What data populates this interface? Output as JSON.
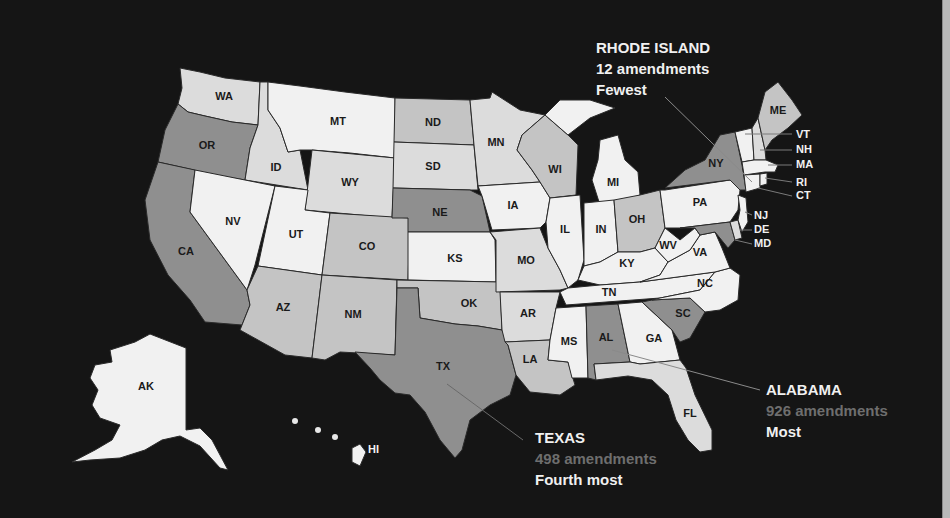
{
  "map": {
    "title": "",
    "legend_shades": {
      "lightest": "#f1f1f1",
      "light": "#dcdcdc",
      "medium_light": "#c4c4c4",
      "medium": "#8f8f8f",
      "background": "#151515"
    },
    "states": {
      "WA": {
        "label": "WA",
        "tier": "light"
      },
      "OR": {
        "label": "OR",
        "tier": "medium"
      },
      "CA": {
        "label": "CA",
        "tier": "medium"
      },
      "ID": {
        "label": "ID",
        "tier": "light"
      },
      "NV": {
        "label": "NV",
        "tier": "lightest"
      },
      "MT": {
        "label": "MT",
        "tier": "lightest"
      },
      "WY": {
        "label": "WY",
        "tier": "light"
      },
      "UT": {
        "label": "UT",
        "tier": "lightest"
      },
      "AZ": {
        "label": "AZ",
        "tier": "medium_light"
      },
      "CO": {
        "label": "CO",
        "tier": "medium_light"
      },
      "NM": {
        "label": "NM",
        "tier": "medium_light"
      },
      "ND": {
        "label": "ND",
        "tier": "medium_light"
      },
      "SD": {
        "label": "SD",
        "tier": "light"
      },
      "NE": {
        "label": "NE",
        "tier": "medium"
      },
      "KS": {
        "label": "KS",
        "tier": "lightest"
      },
      "OK": {
        "label": "OK",
        "tier": "medium_light"
      },
      "TX": {
        "label": "TX",
        "tier": "medium"
      },
      "MN": {
        "label": "MN",
        "tier": "light"
      },
      "IA": {
        "label": "IA",
        "tier": "lightest"
      },
      "MO": {
        "label": "MO",
        "tier": "light"
      },
      "AR": {
        "label": "AR",
        "tier": "light"
      },
      "LA": {
        "label": "LA",
        "tier": "medium_light"
      },
      "WI": {
        "label": "WI",
        "tier": "medium_light"
      },
      "IL": {
        "label": "IL",
        "tier": "lightest"
      },
      "MI": {
        "label": "MI",
        "tier": "lightest"
      },
      "IN": {
        "label": "IN",
        "tier": "lightest"
      },
      "OH": {
        "label": "OH",
        "tier": "medium_light"
      },
      "KY": {
        "label": "KY",
        "tier": "lightest"
      },
      "TN": {
        "label": "TN",
        "tier": "lightest"
      },
      "MS": {
        "label": "MS",
        "tier": "lightest"
      },
      "AL": {
        "label": "AL",
        "tier": "medium"
      },
      "GA": {
        "label": "GA",
        "tier": "lightest"
      },
      "FL": {
        "label": "FL",
        "tier": "light"
      },
      "SC": {
        "label": "SC",
        "tier": "medium"
      },
      "NC": {
        "label": "NC",
        "tier": "lightest"
      },
      "VA": {
        "label": "VA",
        "tier": "lightest"
      },
      "WV": {
        "label": "WV",
        "tier": "lightest"
      },
      "PA": {
        "label": "PA",
        "tier": "lightest"
      },
      "NY": {
        "label": "NY",
        "tier": "medium"
      },
      "NJ": {
        "label": "NJ",
        "tier": "lightest"
      },
      "DE": {
        "label": "DE",
        "tier": "light"
      },
      "MD": {
        "label": "MD",
        "tier": "medium"
      },
      "ME": {
        "label": "ME",
        "tier": "medium_light"
      },
      "VT": {
        "label": "VT",
        "tier": "lightest"
      },
      "NH": {
        "label": "NH",
        "tier": "light"
      },
      "MA": {
        "label": "MA",
        "tier": "lightest"
      },
      "RI": {
        "label": "RI",
        "tier": "lightest"
      },
      "CT": {
        "label": "CT",
        "tier": "lightest"
      },
      "AK": {
        "label": "AK",
        "tier": "lightest"
      },
      "HI": {
        "label": "HI",
        "tier": "lightest"
      }
    }
  },
  "callouts": {
    "rhode_island": {
      "name": "RHODE ISLAND",
      "count": "12 amendments",
      "rank": "Fewest"
    },
    "alabama": {
      "name": "ALABAMA",
      "count": "926 amendments",
      "rank": "Most"
    },
    "texas": {
      "name": "TEXAS",
      "count": "498 amendments",
      "rank": "Fourth most"
    }
  }
}
